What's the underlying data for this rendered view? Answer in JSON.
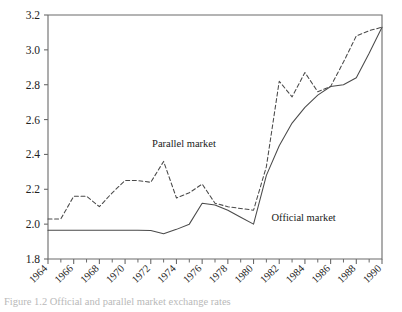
{
  "figure": {
    "caption": "Figure 1.2   Official and parallel market exchange rates"
  },
  "chart_data": {
    "type": "line",
    "title": "",
    "xlabel": "",
    "ylabel": "",
    "xlim": [
      1964,
      1990
    ],
    "ylim": [
      1.8,
      3.2
    ],
    "grid": false,
    "legend_position": "inline-annotations",
    "y_ticks": [
      "1.8",
      "2.0",
      "2.2",
      "2.4",
      "2.6",
      "2.8",
      "3.0",
      "3.2"
    ],
    "y_tick_values": [
      1.8,
      2.0,
      2.2,
      2.4,
      2.6,
      2.8,
      3.0,
      3.2
    ],
    "x_ticks": [
      "1964",
      "1966",
      "1968",
      "1970",
      "1972",
      "1974",
      "1976",
      "1978",
      "1980",
      "1982",
      "1984",
      "1986",
      "1988",
      "1990"
    ],
    "x_tick_values": [
      1964,
      1966,
      1968,
      1970,
      1972,
      1974,
      1976,
      1978,
      1980,
      1982,
      1984,
      1986,
      1988,
      1990
    ],
    "x_minor_tick_values": [
      1965,
      1967,
      1969,
      1971,
      1973,
      1975,
      1977,
      1979,
      1981,
      1983,
      1985,
      1987,
      1989
    ],
    "x": [
      1964,
      1965,
      1966,
      1967,
      1968,
      1969,
      1970,
      1971,
      1972,
      1973,
      1974,
      1975,
      1976,
      1977,
      1978,
      1979,
      1980,
      1981,
      1982,
      1983,
      1984,
      1985,
      1986,
      1987,
      1988,
      1989,
      1990
    ],
    "series": [
      {
        "name": "Parallel market",
        "style": "dashed",
        "color": "#4a4a4a",
        "label_x": 1972.1,
        "label_y": 2.44,
        "values": [
          2.03,
          2.03,
          2.16,
          2.16,
          2.1,
          2.18,
          2.25,
          2.25,
          2.24,
          2.36,
          2.15,
          2.18,
          2.23,
          2.12,
          2.1,
          2.09,
          2.08,
          2.33,
          2.82,
          2.73,
          2.87,
          2.76,
          2.79,
          2.93,
          3.08,
          3.11,
          3.13
        ]
      },
      {
        "name": "Official market",
        "style": "solid",
        "color": "#4a4a4a",
        "label_x": 1981.4,
        "label_y": 2.02,
        "values": [
          1.965,
          1.965,
          1.965,
          1.965,
          1.965,
          1.965,
          1.965,
          1.965,
          1.963,
          1.945,
          1.97,
          2.0,
          2.12,
          2.11,
          2.08,
          2.04,
          2.0,
          2.28,
          2.45,
          2.58,
          2.67,
          2.74,
          2.79,
          2.8,
          2.84,
          2.98,
          3.13
        ]
      }
    ]
  }
}
